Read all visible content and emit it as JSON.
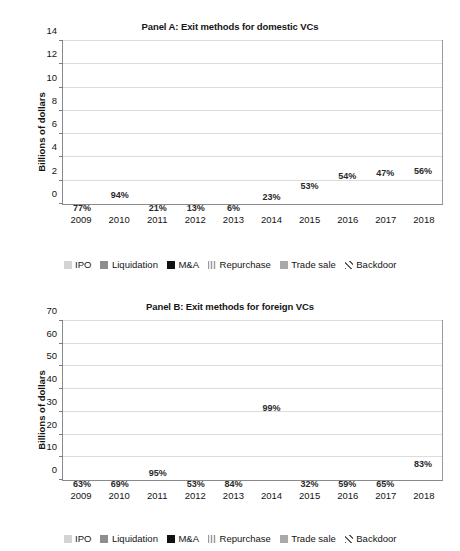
{
  "figure": {
    "ylabel": "Billions of dollars",
    "series": [
      {
        "key": "ipo",
        "label": "IPO"
      },
      {
        "key": "liquidation",
        "label": "Liquidation"
      },
      {
        "key": "mna",
        "label": "M&A"
      },
      {
        "key": "repurchase",
        "label": "Repurchase"
      },
      {
        "key": "tradesale",
        "label": "Trade sale"
      },
      {
        "key": "backdoor",
        "label": "Backdoor"
      }
    ]
  },
  "chart_data": [
    {
      "type": "bar",
      "stacked": true,
      "panel": "A",
      "title": "Panel A: Exit methods for domestic VCs",
      "xlabel": "",
      "ylabel": "Billions of dollars",
      "ylim": [
        0,
        14
      ],
      "yticks": [
        0,
        2,
        4,
        6,
        8,
        10,
        12,
        14
      ],
      "ytick_labels": [
        "0",
        "2",
        "4",
        "6",
        "8",
        "10",
        "12",
        "14"
      ],
      "grid": true,
      "legend_position": "bottom",
      "categories": [
        "2009",
        "2010",
        "2011",
        "2012",
        "2013",
        "2014",
        "2015",
        "2016",
        "2017",
        "2018"
      ],
      "series": [
        {
          "name": "IPO",
          "values": [
            0.15,
            1.95,
            0.05,
            0.05,
            0.05,
            1.65,
            3.55,
            5.2,
            5.35,
            6.0
          ]
        },
        {
          "name": "Liquidation",
          "values": [
            0.0,
            0.0,
            0.0,
            0.0,
            0.0,
            0.0,
            0.0,
            0.0,
            0.0,
            0.0
          ]
        },
        {
          "name": "M&A",
          "values": [
            0.03,
            0.0,
            1.4,
            0.45,
            1.5,
            4.55,
            1.8,
            2.35,
            3.1,
            2.7
          ]
        },
        {
          "name": "Repurchase",
          "values": [
            0.02,
            0.0,
            0.05,
            0.05,
            0.06,
            0.1,
            0.12,
            0.1,
            0.1,
            0.25
          ]
        },
        {
          "name": "Trade sale",
          "values": [
            0.02,
            0.15,
            0.0,
            0.0,
            1.8,
            1.15,
            1.3,
            2.1,
            2.0,
            1.55
          ]
        },
        {
          "name": "Backdoor",
          "values": [
            0.0,
            0.0,
            0.0,
            0.0,
            0.0,
            0.0,
            0.0,
            0.0,
            0.9,
            0.55
          ]
        }
      ],
      "totals": [
        0.22,
        2.1,
        1.5,
        0.55,
        3.41,
        7.45,
        6.77,
        9.75,
        11.45,
        11.05
      ],
      "annotations": [
        {
          "category": "2009",
          "text": "77%"
        },
        {
          "category": "2010",
          "text": "94%"
        },
        {
          "category": "2011",
          "text": "21%"
        },
        {
          "category": "2012",
          "text": "13%"
        },
        {
          "category": "2013",
          "text": "6%"
        },
        {
          "category": "2014",
          "text": "23%"
        },
        {
          "category": "2015",
          "text": "53%"
        },
        {
          "category": "2016",
          "text": "54%"
        },
        {
          "category": "2017",
          "text": "47%"
        },
        {
          "category": "2018",
          "text": "56%"
        }
      ]
    },
    {
      "type": "bar",
      "stacked": true,
      "panel": "B",
      "title": "Panel B: Exit methods for foreign VCs",
      "xlabel": "",
      "ylabel": "Billions of dollars",
      "ylim": [
        0,
        70
      ],
      "yticks": [
        0,
        10,
        20,
        30,
        40,
        50,
        60,
        70
      ],
      "ytick_labels": [
        "0",
        "10",
        "20",
        "30",
        "40",
        "50",
        "60",
        "70"
      ],
      "grid": true,
      "legend_position": "bottom",
      "categories": [
        "2009",
        "2010",
        "2011",
        "2012",
        "2013",
        "2014",
        "2015",
        "2016",
        "2017",
        "2018"
      ],
      "series": [
        {
          "name": "IPO",
          "values": [
            0.25,
            0.3,
            5.3,
            0.2,
            0.3,
            63.3,
            0.6,
            1.7,
            4.1,
            15.9
          ]
        },
        {
          "name": "Liquidation",
          "values": [
            0.0,
            0.0,
            0.0,
            0.0,
            0.0,
            0.0,
            0.0,
            0.0,
            0.0,
            0.0
          ]
        },
        {
          "name": "M&A",
          "values": [
            0.1,
            0.1,
            0.2,
            0.1,
            0.45,
            0.6,
            1.0,
            0.9,
            1.5,
            1.95
          ]
        },
        {
          "name": "Repurchase",
          "values": [
            0.0,
            0.0,
            0.1,
            0.0,
            0.25,
            0.0,
            0.1,
            0.1,
            0.1,
            0.25
          ]
        },
        {
          "name": "Trade sale",
          "values": [
            0.05,
            0.05,
            0.2,
            0.05,
            0.55,
            0.0,
            0.25,
            0.35,
            0.25,
            0.55
          ]
        },
        {
          "name": "Backdoor",
          "values": [
            0.0,
            0.0,
            0.0,
            0.0,
            0.0,
            0.0,
            0.0,
            0.0,
            0.0,
            0.0
          ]
        }
      ],
      "totals": [
        0.4,
        0.45,
        5.8,
        0.35,
        1.55,
        63.9,
        1.95,
        3.05,
        5.95,
        18.65
      ],
      "annotations": [
        {
          "category": "2009",
          "text": "63%"
        },
        {
          "category": "2010",
          "text": "69%"
        },
        {
          "category": "2011",
          "text": "95%"
        },
        {
          "category": "2012",
          "text": "53%"
        },
        {
          "category": "2013",
          "text": "84%"
        },
        {
          "category": "2014",
          "text": "99%"
        },
        {
          "category": "2015",
          "text": "32%"
        },
        {
          "category": "2016",
          "text": "59%"
        },
        {
          "category": "2017",
          "text": "65%"
        },
        {
          "category": "2018",
          "text": "83%"
        }
      ]
    }
  ],
  "colors": {
    "ipo": "#d4d4d4",
    "liquidation": "#8e8e8e",
    "mna": "#111111",
    "repurchase": "#e8e8e8",
    "tradesale": "#a9a9a9",
    "backdoor": "#ffffff",
    "grid": "#dcdcdc",
    "axis": "#8a8a8a"
  }
}
